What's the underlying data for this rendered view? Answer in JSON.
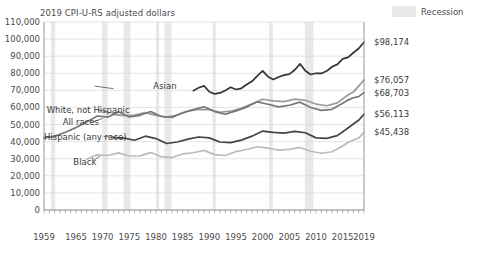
{
  "chart_title": "2019 CPI-U-RS adjusted dollars",
  "legend": {
    "swatch_name": "recession-swatch",
    "label": "Recession"
  },
  "axes": {
    "y_ticks": [
      "0",
      "10,000",
      "20,000",
      "30,000",
      "40,000",
      "50,000",
      "60,000",
      "70,000",
      "80,000",
      "90,000",
      "100,000",
      "110,000"
    ],
    "x_ticks": [
      "1959",
      "1965",
      "1970",
      "1975",
      "1980",
      "1985",
      "1990",
      "1995",
      "2000",
      "2005",
      "2010",
      "2015",
      "2019"
    ]
  },
  "series_labels": [
    {
      "name": "asian-label",
      "text": "Asian"
    },
    {
      "name": "white-label",
      "text": "White, not Hispanic"
    },
    {
      "name": "allraces-label",
      "text": "All races"
    },
    {
      "name": "hispanic-label",
      "text": "Hispanic (any race)"
    },
    {
      "name": "black-label",
      "text": "Black"
    }
  ],
  "end_labels": [
    {
      "name": "end-label-asian",
      "text": "$98,174"
    },
    {
      "name": "end-label-white",
      "text": "$76,057"
    },
    {
      "name": "end-label-allraces",
      "text": "$68,703"
    },
    {
      "name": "end-label-hispanic",
      "text": "$56,113"
    },
    {
      "name": "end-label-black",
      "text": "$45,438"
    }
  ],
  "chart_data": {
    "type": "line",
    "title": "2019 CPI-U-RS adjusted dollars",
    "xlabel": "",
    "ylabel": "",
    "xlim": [
      1959,
      2019
    ],
    "ylim": [
      0,
      110000
    ],
    "ytick_step": 10000,
    "grid": true,
    "legend_position": "top-right",
    "legend_entries": [
      "Recession"
    ],
    "colors": {
      "asian": "#333333",
      "white_not_hispanic": "#999999",
      "all_races": "#777777",
      "hispanic_any_race": "#444444",
      "black": "#bbbbbb",
      "recession_band": "#e8e8e8",
      "gridline": "#d8d8d8",
      "axis": "#8a8a8a"
    },
    "recessions": [
      [
        1960.3,
        1961.1
      ],
      [
        1969.9,
        1970.9
      ],
      [
        1973.9,
        1975.2
      ],
      [
        1980.0,
        1980.6
      ],
      [
        1981.6,
        1982.9
      ],
      [
        1990.6,
        1991.2
      ],
      [
        2001.2,
        2001.9
      ],
      [
        2007.9,
        2009.5
      ]
    ],
    "series": [
      {
        "name": "Asian",
        "color": "#333333",
        "end_value": 98174,
        "x": [
          1987,
          1988,
          1989,
          1990,
          1991,
          1992,
          1993,
          1994,
          1995,
          1996,
          1997,
          1998,
          1999,
          2000,
          2001,
          2002,
          2003,
          2004,
          2005,
          2006,
          2007,
          2008,
          2009,
          2010,
          2011,
          2012,
          2013,
          2014,
          2015,
          2016,
          2017,
          2018,
          2019
        ],
        "y": [
          69800,
          71500,
          72600,
          69200,
          67900,
          68500,
          69900,
          71800,
          70500,
          71200,
          73400,
          75300,
          78500,
          81400,
          78000,
          76400,
          77800,
          78900,
          79500,
          81900,
          85500,
          81500,
          79300,
          80000,
          79900,
          81300,
          83800,
          85200,
          88400,
          89300,
          92000,
          94500,
          98174
        ]
      },
      {
        "name": "White, not Hispanic",
        "color": "#999999",
        "end_value": 76057,
        "x": [
          1972,
          1974,
          1976,
          1978,
          1980,
          1982,
          1984,
          1986,
          1988,
          1990,
          1992,
          1994,
          1996,
          1998,
          2000,
          2002,
          2004,
          2006,
          2008,
          2010,
          2012,
          2014,
          2016,
          2017,
          2018,
          2019
        ],
        "y": [
          56000,
          55200,
          55500,
          57000,
          55400,
          54300,
          55600,
          57800,
          58900,
          58700,
          57200,
          57800,
          59500,
          62100,
          64800,
          63900,
          63400,
          64900,
          64200,
          62000,
          61000,
          62700,
          67300,
          69000,
          72500,
          76057
        ]
      },
      {
        "name": "All races",
        "color": "#777777",
        "end_value": 68703,
        "x": [
          1959,
          1961,
          1963,
          1965,
          1967,
          1969,
          1971,
          1973,
          1975,
          1977,
          1979,
          1981,
          1983,
          1985,
          1987,
          1989,
          1991,
          1993,
          1995,
          1997,
          1999,
          2001,
          2003,
          2005,
          2007,
          2009,
          2011,
          2013,
          2015,
          2016,
          2017,
          2018,
          2019
        ],
        "y": [
          42200,
          43100,
          45500,
          48200,
          51500,
          55000,
          54400,
          57500,
          54400,
          55400,
          57600,
          54700,
          54200,
          56900,
          58700,
          60400,
          57600,
          56000,
          58000,
          60200,
          63300,
          61900,
          60300,
          61300,
          63100,
          60000,
          58300,
          58900,
          62500,
          64300,
          65700,
          66300,
          68703
        ]
      },
      {
        "name": "Hispanic (any race)",
        "color": "#444444",
        "end_value": 56113,
        "x": [
          1972,
          1974,
          1976,
          1978,
          1980,
          1982,
          1984,
          1986,
          1988,
          1990,
          1992,
          1994,
          1996,
          1998,
          2000,
          2002,
          2004,
          2006,
          2008,
          2010,
          2012,
          2014,
          2016,
          2017,
          2018,
          2019
        ],
        "y": [
          42400,
          42100,
          40800,
          43200,
          41800,
          38900,
          39800,
          41500,
          42700,
          42200,
          39800,
          39400,
          40900,
          43200,
          46200,
          45400,
          45000,
          46000,
          45200,
          42200,
          41900,
          43500,
          48000,
          50300,
          52500,
          56113
        ]
      },
      {
        "name": "Black",
        "color": "#bbbbbb",
        "end_value": 45438,
        "x": [
          1967,
          1969,
          1971,
          1973,
          1975,
          1977,
          1979,
          1981,
          1983,
          1985,
          1987,
          1989,
          1991,
          1993,
          1995,
          1997,
          1999,
          2001,
          2003,
          2005,
          2007,
          2009,
          2011,
          2013,
          2015,
          2016,
          2017,
          2018,
          2019
        ],
        "y": [
          29700,
          32300,
          31900,
          33400,
          31600,
          31700,
          33600,
          31200,
          30700,
          32800,
          33500,
          34900,
          32400,
          31900,
          34200,
          35400,
          37000,
          36200,
          35000,
          35500,
          36600,
          34400,
          33200,
          34100,
          37500,
          39500,
          41000,
          42100,
          45438
        ]
      }
    ]
  }
}
